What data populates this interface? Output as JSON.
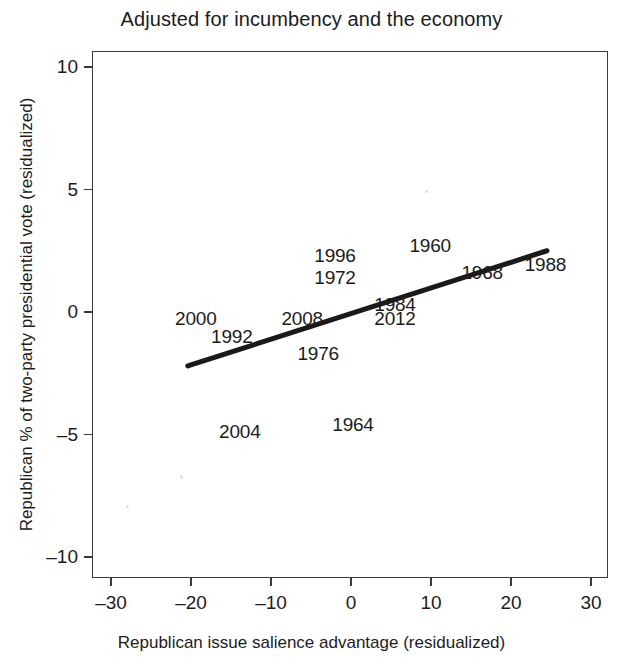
{
  "chart_data": {
    "type": "scatter",
    "title": "Adjusted for incumbency and the economy",
    "xlabel": "Republican issue salience advantage (residualized)",
    "ylabel": "Republican % of two-party presidential vote (residualized)",
    "xlim": [
      -33,
      33
    ],
    "ylim": [
      -11.8,
      11.5
    ],
    "xticks": [
      -30,
      -20,
      -10,
      0,
      10,
      20,
      30
    ],
    "xticklabels": [
      "–30",
      "–20",
      "–10",
      "0",
      "10",
      "20",
      "30"
    ],
    "yticks": [
      10,
      5,
      0,
      -5,
      -10
    ],
    "yticklabels": [
      "10",
      "5",
      "0",
      "–5",
      "–10"
    ],
    "grid": false,
    "legend": null,
    "marker_style": "text-labels",
    "points": [
      {
        "label": "2000",
        "x": -19.4,
        "y": -0.3
      },
      {
        "label": "1992",
        "x": -14.9,
        "y": -1.0
      },
      {
        "label": "2004",
        "x": -13.9,
        "y": -4.9
      },
      {
        "label": "2008",
        "x": -6.1,
        "y": -0.3
      },
      {
        "label": "1976",
        "x": -4.1,
        "y": -1.7
      },
      {
        "label": "1996",
        "x": -2.0,
        "y": 2.3
      },
      {
        "label": "1972",
        "x": -2.0,
        "y": 1.4
      },
      {
        "label": "1964",
        "x": 0.25,
        "y": -4.6
      },
      {
        "label": "1984",
        "x": 5.5,
        "y": 0.3
      },
      {
        "label": "2012",
        "x": 5.5,
        "y": -0.3
      },
      {
        "label": "1960",
        "x": 9.9,
        "y": 2.7
      },
      {
        "label": "1968",
        "x": 16.4,
        "y": 1.6
      },
      {
        "label": "1988",
        "x": 24.3,
        "y": 1.9
      }
    ],
    "fit_line": {
      "type": "linear-regression",
      "x_start": -20.4,
      "y_start": -2.2,
      "x_end": 24.5,
      "y_end": 2.5,
      "color": "#1a1a1a",
      "width_px": 5
    },
    "annotations": []
  }
}
